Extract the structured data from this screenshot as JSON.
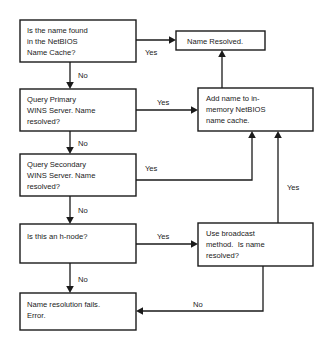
{
  "diagram": {
    "type": "flowchart",
    "colors": {
      "background": "#ffffff",
      "stroke": "#1a1a1a",
      "box_fill": "#ffffff",
      "text": "#1a1a1a"
    },
    "nodes": [
      {
        "id": "name-cache-check",
        "shape": "rectangle",
        "x": 20,
        "y": 20,
        "w": 116,
        "h": 42,
        "lines": [
          "Is the name found",
          "in the NetBIOS",
          "Name Cache?"
        ]
      },
      {
        "id": "name-resolved",
        "shape": "rectangle",
        "x": 176,
        "y": 31,
        "w": 89,
        "h": 19,
        "lines": [
          "Name Resolved."
        ]
      },
      {
        "id": "query-primary-wins",
        "shape": "rectangle",
        "x": 20,
        "y": 89,
        "w": 116,
        "h": 42,
        "lines": [
          "Query Primary",
          "WINS Server. Name",
          "resolved?"
        ]
      },
      {
        "id": "add-name-to-cache",
        "shape": "rectangle",
        "x": 198,
        "y": 88,
        "w": 115,
        "h": 43,
        "lines": [
          "Add name to in-",
          "memory NetBIOS",
          "name cache."
        ]
      },
      {
        "id": "query-secondary-wins",
        "shape": "rectangle",
        "x": 20,
        "y": 154,
        "w": 116,
        "h": 42,
        "lines": [
          "Query Secondary",
          "WINS Server. Name",
          "resolved?"
        ]
      },
      {
        "id": "h-node-check",
        "shape": "rectangle",
        "x": 20,
        "y": 224,
        "w": 116,
        "h": 39,
        "lines": [
          "Is this an h-node?"
        ]
      },
      {
        "id": "use-broadcast",
        "shape": "rectangle",
        "x": 198,
        "y": 223,
        "w": 115,
        "h": 43,
        "lines": [
          "Use broadcast",
          "method.  Is name",
          "resolved?"
        ]
      },
      {
        "id": "name-resolution-fails",
        "shape": "rectangle",
        "x": 20,
        "y": 293,
        "w": 116,
        "h": 37,
        "lines": [
          "Name resolution fails.",
          "Error."
        ]
      }
    ],
    "edges": [
      {
        "id": "cache-yes",
        "from": "name-cache-check",
        "to": "name-resolved",
        "label": "Yes",
        "label_x": 145,
        "label_y": 52
      },
      {
        "id": "cache-no",
        "from": "name-cache-check",
        "to": "query-primary-wins",
        "label": "No",
        "label_x": 78,
        "label_y": 76
      },
      {
        "id": "primary-yes",
        "from": "query-primary-wins",
        "to": "add-name-to-cache",
        "label": "Yes",
        "label_x": 157,
        "label_y": 104
      },
      {
        "id": "primary-no",
        "from": "query-primary-wins",
        "to": "query-secondary-wins",
        "label": "No",
        "label_x": 78,
        "label_y": 145
      },
      {
        "id": "secondary-yes",
        "from": "query-secondary-wins",
        "to": "add-name-to-cache",
        "label": "Yes",
        "label_x": 145,
        "label_y": 168
      },
      {
        "id": "secondary-no",
        "from": "query-secondary-wins",
        "to": "h-node-check",
        "label": "No",
        "label_x": 78,
        "label_y": 211
      },
      {
        "id": "hnode-yes",
        "from": "h-node-check",
        "to": "use-broadcast",
        "label": "Yes",
        "label_x": 157,
        "label_y": 238
      },
      {
        "id": "hnode-no",
        "from": "h-node-check",
        "to": "name-resolution-fails",
        "label": "No",
        "label_x": 78,
        "label_y": 280
      },
      {
        "id": "broadcast-yes",
        "from": "use-broadcast",
        "to": "add-name-to-cache",
        "label": "Yes",
        "label_x": 287,
        "label_y": 187
      },
      {
        "id": "broadcast-no",
        "from": "use-broadcast",
        "to": "name-resolution-fails",
        "label": "No",
        "label_x": 196,
        "label_y": 305
      },
      {
        "id": "cache-add-to-resolved",
        "from": "add-name-to-cache",
        "to": "name-resolved",
        "label": "",
        "label_x": 0,
        "label_y": 0
      }
    ]
  }
}
